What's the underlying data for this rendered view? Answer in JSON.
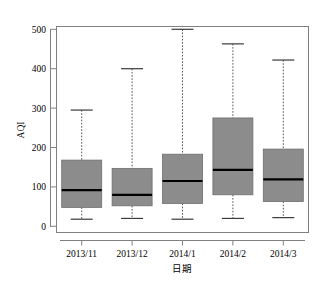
{
  "chart_data": {
    "type": "box",
    "title": "",
    "xlabel": "日期",
    "ylabel": "AQI",
    "categories": [
      "2013/11",
      "2013/12",
      "2014/1",
      "2014/2",
      "2014/3"
    ],
    "ylim": [
      0,
      520
    ],
    "yticks": [
      0,
      100,
      200,
      300,
      400,
      500
    ],
    "ytick_labels": [
      "0",
      "100",
      "200",
      "300",
      "400",
      "500"
    ],
    "grid": false,
    "legend": "none",
    "box_fill_color": "#8c8c8c",
    "box_edge_color": "#000000",
    "median_color": "#000000",
    "whisker_style": "dotted",
    "boxes": [
      {
        "category": "2013/11",
        "whisker_low": 18,
        "q1": 48,
        "median": 92,
        "q3": 168,
        "whisker_high": 295
      },
      {
        "category": "2013/12",
        "whisker_low": 20,
        "q1": 52,
        "median": 80,
        "q3": 147,
        "whisker_high": 400
      },
      {
        "category": "2014/1",
        "whisker_low": 18,
        "q1": 58,
        "median": 115,
        "q3": 183,
        "whisker_high": 500
      },
      {
        "category": "2014/2",
        "whisker_low": 20,
        "q1": 80,
        "median": 143,
        "q3": 275,
        "whisker_high": 463
      },
      {
        "category": "2014/3",
        "whisker_low": 22,
        "q1": 63,
        "median": 119,
        "q3": 196,
        "whisker_high": 422
      }
    ]
  }
}
